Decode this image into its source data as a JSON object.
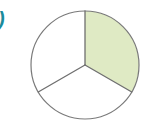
{
  "figure": {
    "part_label": "a)",
    "background_color": "#ffffff",
    "outline_color": "#7a7a7a",
    "shade_color": "#dfeac4",
    "label_color": "#1b8b9b",
    "unshaded_color": "#ffffff"
  },
  "chart_data": {
    "type": "pie",
    "title": "",
    "subtitle": "",
    "xlabel": "",
    "ylabel": "",
    "legend_position": "none",
    "grid": false,
    "center": {
      "cx": 85,
      "cy": 65
    },
    "radius": 54,
    "total_parts": 3,
    "shaded_parts": 1,
    "fraction": "1/3",
    "fraction_value": 0.3333,
    "start_angle_deg": 0,
    "categories": [
      "shaded",
      "unshaded-left",
      "unshaded-bottom"
    ],
    "values": [
      1,
      1,
      1
    ],
    "slice_angles_deg": [
      120,
      120,
      120
    ],
    "slices": [
      {
        "name": "shaded",
        "label": "shaded sector",
        "value": 1,
        "angle_deg": 120,
        "start_deg": 0,
        "end_deg": 120,
        "fill": "#dfeac4",
        "shaded": true
      },
      {
        "name": "unshaded-bottom",
        "label": "unshaded sector (lower)",
        "value": 1,
        "angle_deg": 120,
        "start_deg": 120,
        "end_deg": 240,
        "fill": "#ffffff",
        "shaded": false
      },
      {
        "name": "unshaded-left",
        "label": "unshaded sector (left)",
        "value": 1,
        "angle_deg": 120,
        "start_deg": 240,
        "end_deg": 360,
        "fill": "#ffffff",
        "shaded": false
      }
    ],
    "annotations": []
  }
}
